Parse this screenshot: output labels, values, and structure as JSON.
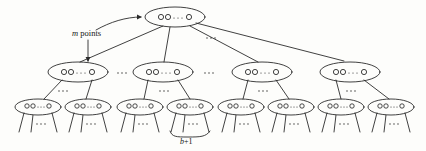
{
  "figure": {
    "type": "tree-diagram",
    "background_color": "#fdfdfb",
    "stroke_color": "#2b2b2b",
    "text_color": "#151515",
    "node_label": "OO...O",
    "node_label_parts": {
      "circles_left": 2,
      "ellipsis": "...",
      "circles_right": 1
    },
    "annotations": {
      "m_points": "m points",
      "b_plus_1": "b+1",
      "ellipsis": "..."
    },
    "levels": [
      {
        "name": "root-level",
        "count": 1,
        "nodes": [
          {
            "id": "root",
            "label": "OO...O",
            "cx": 175,
            "cy": 17,
            "rx": 30,
            "ry": 10
          }
        ]
      },
      {
        "name": "level-2",
        "count": 4,
        "ellipsis_labels": [
          "...",
          "...",
          "..."
        ],
        "nodes": [
          {
            "id": "n2-1",
            "label": "OO...O",
            "cx": 78,
            "cy": 72,
            "rx": 30,
            "ry": 10
          },
          {
            "id": "n2-2",
            "label": "OO...O",
            "cx": 163,
            "cy": 72,
            "rx": 30,
            "ry": 10
          },
          {
            "id": "n2-3",
            "label": "OO...O",
            "cx": 262,
            "cy": 72,
            "rx": 30,
            "ry": 10
          },
          {
            "id": "n2-4",
            "label": "OO...O",
            "cx": 350,
            "cy": 72,
            "rx": 30,
            "ry": 10
          }
        ]
      },
      {
        "name": "level-3-leaves",
        "count": 8,
        "nodes": [
          {
            "id": "n3-1",
            "label": "OO...O",
            "cx": 38,
            "cy": 107,
            "rx": 23,
            "ry": 8
          },
          {
            "id": "n3-2",
            "label": "OO...O",
            "cx": 88,
            "cy": 107,
            "rx": 23,
            "ry": 8
          },
          {
            "id": "n3-3",
            "label": "OO...O",
            "cx": 140,
            "cy": 107,
            "rx": 23,
            "ry": 8
          },
          {
            "id": "n3-4",
            "label": "OO...O",
            "cx": 190,
            "cy": 107,
            "rx": 23,
            "ry": 8
          },
          {
            "id": "n3-5",
            "label": "OO...O",
            "cx": 241,
            "cy": 107,
            "rx": 23,
            "ry": 8
          },
          {
            "id": "n3-6",
            "label": "OO...O",
            "cx": 291,
            "cy": 107,
            "rx": 23,
            "ry": 8
          },
          {
            "id": "n3-7",
            "label": "OO...O",
            "cx": 341,
            "cy": 107,
            "rx": 23,
            "ry": 8
          },
          {
            "id": "n3-8",
            "label": "OO...O",
            "cx": 391,
            "cy": 107,
            "rx": 23,
            "ry": 8
          }
        ]
      }
    ]
  }
}
